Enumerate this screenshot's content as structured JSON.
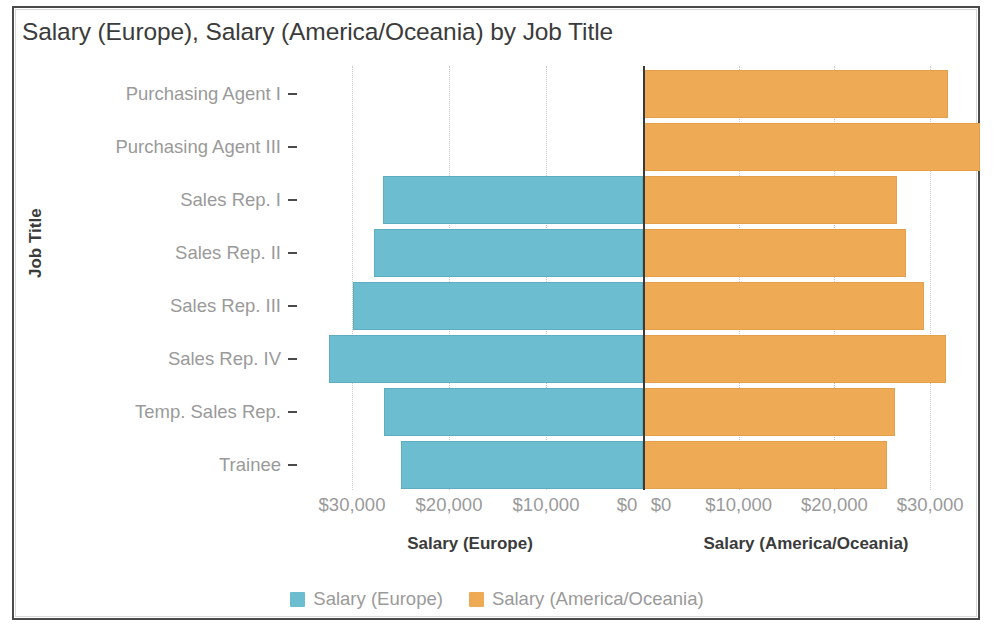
{
  "chart_data": {
    "type": "bar",
    "subtype": "diverging-bidirectional-bar",
    "title": "Salary (Europe), Salary (America/Oceania) by Job Title",
    "orientation": "horizontal",
    "categories": [
      "Purchasing Agent I",
      "Purchasing Agent III",
      "Sales Rep. I",
      "Sales Rep. II",
      "Sales Rep. III",
      "Sales Rep. IV",
      "Temp. Sales Rep.",
      "Trainee"
    ],
    "series": [
      {
        "name": "Salary (Europe)",
        "color": "#6dbdd1",
        "side": "left",
        "axis_title": "Salary (Europe)",
        "axis_ticks": [
          "$30,000",
          "$20,000",
          "$10,000",
          "$0"
        ],
        "axis_tick_values": [
          30000,
          20000,
          10000,
          0
        ],
        "axis_range": [
          0,
          36800
        ],
        "axis_direction": "reversed",
        "values": [
          0,
          0,
          26800,
          27700,
          29900,
          32400,
          26700,
          24950
        ]
      },
      {
        "name": "Salary (America/Oceania)",
        "color": "#efaa55",
        "side": "right",
        "axis_title": "Salary (America/Oceania)",
        "axis_ticks": [
          "$0",
          "$10,000",
          "$20,000",
          "$30,000"
        ],
        "axis_tick_values": [
          0,
          10000,
          20000,
          30000
        ],
        "axis_range": [
          0,
          36000
        ],
        "axis_direction": "normal",
        "values": [
          31900,
          35200,
          26500,
          27500,
          29400,
          31700,
          26300,
          25500
        ]
      }
    ],
    "ylabel": "Job Title",
    "xlabel": "",
    "grid": true,
    "grid_style": "dotted-vertical",
    "legend": {
      "position": "bottom-center",
      "entries": [
        {
          "label": "Salary (Europe)",
          "color": "#6dbdd1"
        },
        {
          "label": "Salary (America/Oceania)",
          "color": "#efaa55"
        }
      ]
    }
  },
  "colors": {
    "europe": "#6dbdd1",
    "america_oceania": "#efaa55",
    "axis": "#3a3a3a",
    "tick_text": "#9a9a9a",
    "title_text": "#3b3b3b",
    "gridline": "#c9c9c9",
    "background": "#ffffff"
  }
}
